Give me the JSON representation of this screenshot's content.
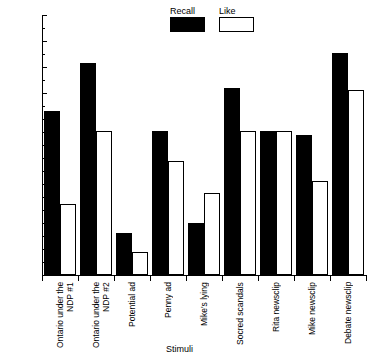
{
  "chart_data": {
    "type": "bar",
    "title": "",
    "xlabel": "Stimuli",
    "ylabel": "Percentile",
    "ylim": [
      0,
      100
    ],
    "ytick_step": 10,
    "yticks": [
      0,
      10,
      20,
      30,
      40,
      50,
      60,
      70,
      80,
      90,
      100
    ],
    "ytick_labels": [
      "0",
      "10",
      "20",
      "30",
      "40",
      "50",
      "60",
      "70",
      "80",
      "90",
      "100"
    ],
    "grid": false,
    "legend_position": "top-center",
    "categories": [
      "Ontario under the\nNDP #1",
      "Ontario under the\nNDP #2",
      "Potential ad",
      "Penny ad",
      "Mike's lying",
      "Socred scandals",
      "Rita newsclip",
      "Mike newsclip",
      "Debate newsclip"
    ],
    "series": [
      {
        "name": "Recall",
        "color": "#000000",
        "values": [
          63,
          81.5,
          16,
          55.5,
          20,
          72,
          55.5,
          54,
          85.5
        ]
      },
      {
        "name": "Like",
        "color": "#ffffff",
        "values": [
          27.5,
          55.5,
          9,
          44,
          31.5,
          55.5,
          55.5,
          36,
          71
        ]
      }
    ]
  },
  "legend": {
    "entries": [
      {
        "label": "Recall",
        "swatch": "filled-black"
      },
      {
        "label": "Like",
        "swatch": "outlined-white"
      }
    ]
  },
  "axes": {
    "y_title": "Percentile",
    "x_title": "Stimuli"
  }
}
